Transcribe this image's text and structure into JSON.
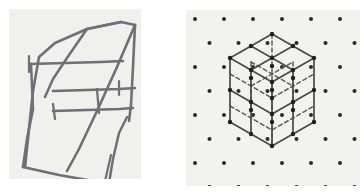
{
  "figure": {
    "background_color": "#ffffff",
    "panel_count": 2
  },
  "panels": [
    {
      "id": "freehand-sketch",
      "name": "freehand-parallelepiped-sketch",
      "caption": "",
      "background_color": "#f0f0ee",
      "stroke_color": "#6b6b70",
      "style": "hand-drawn pencil",
      "shape": "skewed cube / parallelepiped wireframe",
      "x": 9,
      "y": 9,
      "width": 132,
      "height": 170
    },
    {
      "id": "isometric-grid",
      "name": "isometric-dot-grid-cube",
      "caption": "",
      "background_color": "#f2f2f0",
      "stroke_color": "#4a4a4a",
      "dot_color": "#2b2b2b",
      "hidden_edge_style": "dashed",
      "shape": "2x2x2 cube on triangular dot lattice",
      "x": 186,
      "y": 10,
      "width": 174,
      "height": 176
    }
  ],
  "chart_data": {
    "type": "diagram",
    "subfigures": [
      {
        "label": "left",
        "kind": "freehand-sketch",
        "description": "Hand-drawn wireframe of an oblique parallelepiped with visible front face, receding top face and crossing internal edges.",
        "vertices_2d": [
          [
            22,
            52
          ],
          [
            95,
            24
          ],
          [
            127,
            15
          ],
          [
            55,
            44
          ],
          [
            25,
            118
          ],
          [
            97,
            92
          ],
          [
            129,
            84
          ],
          [
            57,
            112
          ],
          [
            16,
            160
          ],
          [
            79,
            172
          ],
          [
            113,
            160
          ],
          [
            48,
            149
          ]
        ],
        "edges": [
          [
            0,
            1
          ],
          [
            1,
            2
          ],
          [
            2,
            3
          ],
          [
            3,
            0
          ],
          [
            4,
            5
          ],
          [
            5,
            6
          ],
          [
            6,
            7
          ],
          [
            7,
            4
          ],
          [
            8,
            9
          ],
          [
            9,
            10
          ],
          [
            10,
            11
          ],
          [
            11,
            8
          ]
        ],
        "stroke_color": "#6b6b70",
        "stroke_width": 2.4
      },
      {
        "label": "right",
        "kind": "isometric-lattice-cube",
        "description": "A 2x2x2 cube drawn on an isometric triangular dot grid; solid lines are visible edges, dashed lines are hidden interior edges.",
        "grid": {
          "lattice": "triangular/isometric",
          "dot_color": "#2b2b2b",
          "dot_radius": 2.0,
          "column_spacing_x": 29,
          "row_spacing_y": 24,
          "row_offset_x": 14.5,
          "columns": 7,
          "rows": 8
        },
        "cube": {
          "divisions": 2,
          "top_vertex": [
            86,
            24
          ],
          "bottom_vertex": [
            86,
            136
          ],
          "left_vertex": [
            44,
            48
          ],
          "right_vertex": [
            128,
            48
          ],
          "left_lower_vertex": [
            44,
            112
          ],
          "right_lower_vertex": [
            128,
            112
          ],
          "center_vertex": [
            86,
            80
          ],
          "half_width": 42,
          "half_height": 24,
          "vertical_edge": 64,
          "solid_stroke_color": "#4a4a4a",
          "dashed_stroke_color": "#5a5a5a",
          "stroke_width": 1.6,
          "dash_pattern": "4 3",
          "node_dot_radius": 2.2,
          "node_dot_color": "#1f1f1f"
        }
      }
    ]
  }
}
